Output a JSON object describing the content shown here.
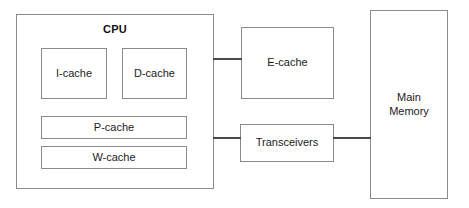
{
  "diagram": {
    "colors": {
      "background": "#ffffff",
      "box_border": "#8a8a8a",
      "connector": "#4a4a4a",
      "text": "#1a1a1a"
    },
    "cpu": {
      "title": "CPU",
      "caches": [
        {
          "label": "I-cache"
        },
        {
          "label": "D-cache"
        },
        {
          "label": "P-cache"
        },
        {
          "label": "W-cache"
        }
      ]
    },
    "external_blocks": [
      {
        "label": "E-cache"
      },
      {
        "label": "Transceivers"
      },
      {
        "label": "Main\nMemory"
      }
    ],
    "connections": [
      {
        "from": "CPU",
        "to": "E-cache"
      },
      {
        "from": "CPU",
        "to": "Transceivers"
      },
      {
        "from": "Transceivers",
        "to": "Main Memory"
      }
    ]
  }
}
